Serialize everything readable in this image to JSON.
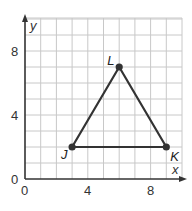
{
  "graph": {
    "x_axis_label": "x",
    "y_axis_label": "y",
    "x_range": [
      0,
      10
    ],
    "y_range": [
      0,
      10
    ],
    "x_tick_labels": [
      "0",
      "4",
      "8"
    ],
    "y_tick_labels": [
      "0",
      "4",
      "8"
    ],
    "grid": true,
    "colors": {
      "grid": "#c8c8c8",
      "axis": "#333333",
      "shape": "#333333"
    }
  },
  "points": [
    {
      "label": "J",
      "x": 3,
      "y": 2
    },
    {
      "label": "K",
      "x": 9,
      "y": 2
    },
    {
      "label": "L",
      "x": 6,
      "y": 7
    }
  ]
}
